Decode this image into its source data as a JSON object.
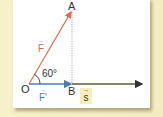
{
  "figure": {
    "points": {
      "A": "A",
      "O": "O",
      "B": "B"
    },
    "angle_label": "60°",
    "vectors": {
      "force": {
        "symbol": "F",
        "arrow": "→",
        "color": "#e06a4c"
      },
      "force_projection": {
        "symbol": "F'",
        "arrow": "→",
        "color": "#4a7fb5"
      },
      "displacement": {
        "symbol": "s",
        "arrow": "→",
        "color": "#333333",
        "highlight": "#f4efb4"
      }
    },
    "colors": {
      "background": "#f6f0c8",
      "panel": "#ffffff",
      "force_line": "#e06a4c",
      "projection_line": "#4a7fb5",
      "displacement_line": "#5a5a3a",
      "dotted_line": "#8a9ab0"
    }
  }
}
